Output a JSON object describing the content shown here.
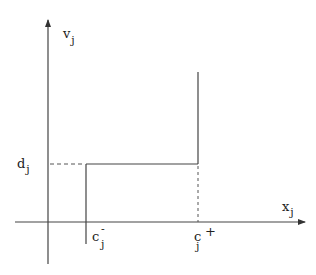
{
  "diagram": {
    "type": "step-function-plot",
    "axes": {
      "y_label": "v",
      "y_label_sub": "j",
      "x_label": "x",
      "x_label_sub": "j"
    },
    "labels": {
      "d": {
        "main": "d",
        "sub": "j"
      },
      "c_minus": {
        "main": "c",
        "sub": "j",
        "sup": "-"
      },
      "c_plus": {
        "main": "c",
        "sub": "j",
        "sup": "+"
      }
    },
    "colors": {
      "line": "#444444",
      "text": "#222222",
      "background": "#ffffff"
    }
  }
}
